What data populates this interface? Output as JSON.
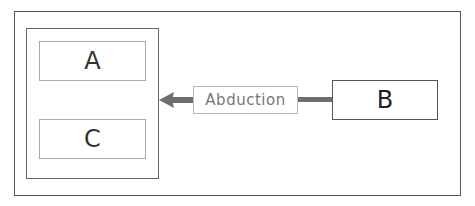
{
  "diagram": {
    "container_boxes": [
      {
        "id": "A",
        "label": "A"
      },
      {
        "id": "C",
        "label": "C"
      }
    ],
    "source_box": {
      "id": "B",
      "label": "B"
    },
    "edge": {
      "label": "Abduction",
      "from": "B",
      "to": "container(A,C)",
      "color": "#6e6e6e"
    },
    "colors": {
      "frame": "#555555",
      "inner_box_border": "#aaaaaa",
      "label_text": "#777777",
      "arrow": "#6e6e6e"
    }
  }
}
